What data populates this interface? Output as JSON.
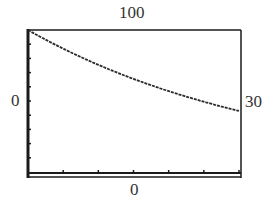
{
  "chart_data": {
    "type": "line",
    "title": "",
    "xlabel": "",
    "ylabel": "",
    "xlim": [
      0,
      30
    ],
    "ylim": [
      0,
      100
    ],
    "grid": false,
    "legend": null,
    "window_labels": {
      "ymax": "100",
      "xmin": "0",
      "xmax": "30",
      "ymin": "0"
    },
    "x_ticks": [
      5,
      10,
      15,
      20,
      25,
      30
    ],
    "y_ticks": [
      10,
      20,
      30,
      40,
      50,
      60,
      70,
      80,
      90
    ],
    "series": [
      {
        "name": "decay curve",
        "style": "dotted-pixel",
        "x": [
          0,
          2,
          4,
          6,
          8,
          10,
          12,
          14,
          16,
          18,
          20,
          22,
          24,
          26,
          28,
          30
        ],
        "y": [
          100,
          94,
          89,
          84,
          79,
          75,
          71,
          67,
          63,
          60,
          57,
          54,
          51,
          48,
          46,
          43
        ]
      }
    ]
  },
  "colors": {
    "frame": "#1a1a1a",
    "curve": "#2a2a2a",
    "label": "#333333"
  }
}
